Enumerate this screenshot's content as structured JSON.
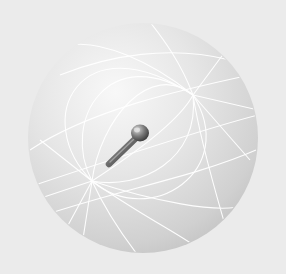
{
  "image": {
    "subject": "Grey sphere with white great-circle grid lines and a metallic pin inserted",
    "background_color": "#ebebeb",
    "sphere": {
      "center": [
        143,
        138
      ],
      "radius": 115,
      "highlight_color": "#f6f6f6",
      "shade_color": "#c4c4c4",
      "grid_line_color": "#ffffff",
      "poles": [
        [
          92,
          181
        ],
        [
          193,
          95
        ]
      ]
    },
    "pin": {
      "tip": [
        107,
        165
      ],
      "head": [
        140,
        133
      ],
      "color_light": "#9a9a9a",
      "color_dark": "#3c3c3c"
    }
  }
}
